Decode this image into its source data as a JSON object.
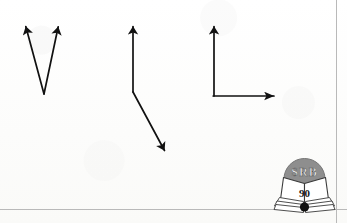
{
  "page": {
    "width": 347,
    "height": 223,
    "background_color": "#fdfdfc",
    "ink_color": "#111111",
    "rule_color": "#b9b9b9"
  },
  "figure": {
    "caption": "",
    "stroke_color": "#111111",
    "stroke_width": 1.6,
    "shapes": [
      {
        "name": "v-shape-two-arrows",
        "description": "Two arrows sharing a common tail point, forming a V",
        "vertex": [
          44,
          94
        ],
        "arrows": [
          {
            "name": "v-left-arrow",
            "from": [
              44,
              94
            ],
            "to": [
              25,
              23
            ]
          },
          {
            "name": "v-right-arrow",
            "from": [
              44,
              94
            ],
            "to": [
              59,
              23
            ]
          }
        ]
      },
      {
        "name": "bent-polyline-arrow",
        "description": "Vertical arrow pointing up from a corner, with a line bending down-right to a second arrowhead",
        "corner": [
          133,
          92
        ],
        "arrows": [
          {
            "name": "middle-up-arrow",
            "from": [
              133,
              92
            ],
            "to": [
              133,
              22
            ]
          },
          {
            "name": "middle-down-right-arrow",
            "from": [
              133,
              92
            ],
            "to": [
              169,
              158
            ]
          }
        ]
      },
      {
        "name": "right-angle-axes",
        "description": "Two perpendicular arrows from a common corner forming an L, like coordinate axes",
        "corner": [
          214,
          96
        ],
        "arrows": [
          {
            "name": "axes-up-arrow",
            "from": [
              214,
              96
            ],
            "to": [
              214,
              22
            ]
          },
          {
            "name": "axes-right-arrow",
            "from": [
              214,
              96
            ],
            "to": [
              284,
              96
            ]
          }
        ]
      }
    ]
  },
  "rules": {
    "bottom_rule": {
      "name": "bottom-rule-line",
      "x": 0,
      "y": 209,
      "length": 347
    },
    "right_rule": {
      "name": "right-rule-line",
      "x": 336,
      "y": 0,
      "length": 223
    }
  },
  "logo": {
    "name": "srb-publisher-logo",
    "monogram": "SRB",
    "number": "90",
    "disc_color": "#8e8e8e",
    "monogram_color": "#efefef",
    "number_color": "#1a1a1a",
    "book_color": "#ffffff",
    "book_outline_color": "#3a3a3a"
  }
}
